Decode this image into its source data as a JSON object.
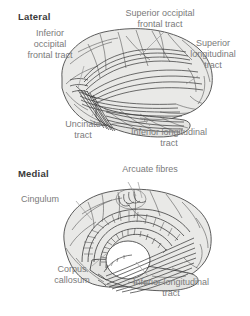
{
  "figure": {
    "type": "anatomical-diagram",
    "colors": {
      "background": "#ffffff",
      "label_text": "#7a7a7a",
      "title_text": "#3a3a3a",
      "outline": "#4d4d4d",
      "fill": "#e8e8e6",
      "leader_line": "#9a9a9a"
    }
  },
  "panels": [
    {
      "id": "lateral",
      "title": "Lateral",
      "labels": [
        {
          "id": "inferior-occipital-frontal-tract",
          "text": "Inferior\noccipital\nfrontal tract"
        },
        {
          "id": "superior-occipital-frontal-tract",
          "text": "Superior occipital\nfrontal tract"
        },
        {
          "id": "superior-longitudinal-tract",
          "text": "Superior\nlongitudinal\ntract"
        },
        {
          "id": "uncinate-tract",
          "text": "Uncinate\ntract"
        },
        {
          "id": "inferior-longitudinal-tract",
          "text": "Inferior longitudinal\ntract"
        }
      ]
    },
    {
      "id": "medial",
      "title": "Medial",
      "labels": [
        {
          "id": "arcuate-fibres",
          "text": "Arcuate fibres"
        },
        {
          "id": "cingulum",
          "text": "Cingulum"
        },
        {
          "id": "corpus-callosum",
          "text": "Corpus\ncallosum"
        },
        {
          "id": "inferior-longitudinal-tract",
          "text": "Inferior longitudinal\ntract"
        }
      ]
    }
  ]
}
